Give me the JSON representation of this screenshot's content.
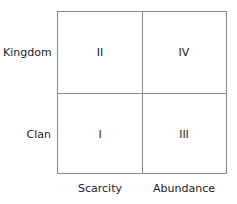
{
  "rows": [
    {
      "label": "Kingdom"
    },
    {
      "label": "Clan"
    }
  ],
  "columns": [
    {
      "label": "Scarcity"
    },
    {
      "label": "Abundance"
    }
  ],
  "cells": {
    "top_left": "II",
    "top_right": "IV",
    "bottom_left": "I",
    "bottom_right": "III"
  }
}
